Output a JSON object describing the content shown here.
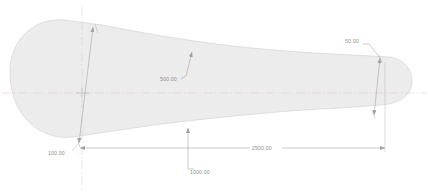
{
  "drawing": {
    "title": "Technical profile drawing",
    "units_note": "",
    "colors": {
      "background": "#ffffff",
      "part_fill": "#ececec",
      "part_outline": "#d2d2d2",
      "dimension_line": "#a8a8a8",
      "centerline": "#d8c8c8",
      "dimension_text": "#8d8d8d"
    },
    "part": {
      "name": "airfoil-profile",
      "description": "Teardrop / blade shaped closed profile with large rounded left bulb, tapering body and small rounded right tip"
    },
    "centerlines": [
      {
        "id": "horizontal-centerline",
        "orientation": "horizontal"
      },
      {
        "id": "vertical-centerline",
        "orientation": "vertical"
      }
    ],
    "dimensions": [
      {
        "id": "dim-100",
        "value": "100.00",
        "kind": "linear-aligned",
        "note": "vertical-ish dimension across left bulb section"
      },
      {
        "id": "dim-500",
        "value": "500.00",
        "kind": "leader",
        "note": "leader pointing at upper profile curve"
      },
      {
        "id": "dim-1000",
        "value": "1000.00",
        "kind": "leader",
        "note": "leader dropping from lower profile to baseline"
      },
      {
        "id": "dim-2500",
        "value": "2500.00",
        "kind": "linear-horizontal",
        "note": "overall horizontal baseline dimension to right tip"
      },
      {
        "id": "dim-50",
        "value": "50.00",
        "kind": "linear-aligned",
        "note": "small aligned dimension across right tip"
      }
    ]
  }
}
